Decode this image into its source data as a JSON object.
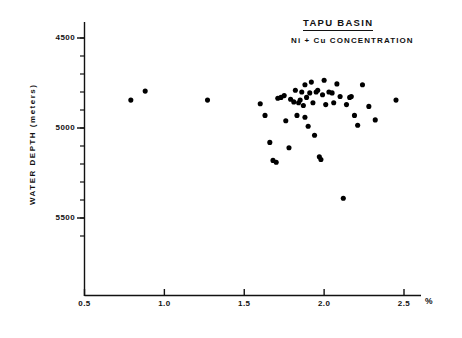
{
  "header": {
    "basin_title": "TAPU BASIN",
    "subtitle": "Ni + Cu  CONCENTRATION"
  },
  "axes": {
    "y_title": "WATER  DEPTH  (meters)",
    "y_ticks": [
      "4500",
      "5000",
      "5500"
    ],
    "x_ticks": [
      "0.5",
      "1.0",
      "1.5",
      "2.0",
      "2.5"
    ],
    "x_unit": "%"
  },
  "chart_data": {
    "type": "scatter",
    "title": "TAPU BASIN",
    "subtitle": "Ni + Cu CONCENTRATION",
    "xlabel": "%",
    "ylabel": "WATER DEPTH (meters)",
    "xlim": [
      0.5,
      2.5
    ],
    "ylim": [
      4300,
      5650
    ],
    "y_inverted": true,
    "grid": false,
    "legend": null,
    "x_ticks": [
      0.5,
      1.0,
      1.5,
      2.0,
      2.5
    ],
    "y_ticks": [
      4500,
      5000,
      5500
    ],
    "x_minor_step": 0.1,
    "y_minor_step": 100,
    "marker": "filled-circle",
    "marker_color": "#000000",
    "n_points": 51,
    "points": [
      {
        "x": 0.79,
        "y": 4845
      },
      {
        "x": 0.88,
        "y": 4795
      },
      {
        "x": 1.27,
        "y": 4845
      },
      {
        "x": 1.6,
        "y": 4865
      },
      {
        "x": 1.63,
        "y": 4930
      },
      {
        "x": 1.66,
        "y": 5080
      },
      {
        "x": 1.68,
        "y": 5180
      },
      {
        "x": 1.7,
        "y": 5190
      },
      {
        "x": 1.71,
        "y": 4835
      },
      {
        "x": 1.73,
        "y": 4830
      },
      {
        "x": 1.75,
        "y": 4820
      },
      {
        "x": 1.76,
        "y": 4960
      },
      {
        "x": 1.78,
        "y": 5110
      },
      {
        "x": 1.79,
        "y": 4840
      },
      {
        "x": 1.81,
        "y": 4855
      },
      {
        "x": 1.82,
        "y": 4790
      },
      {
        "x": 1.83,
        "y": 4930
      },
      {
        "x": 1.84,
        "y": 4860
      },
      {
        "x": 1.85,
        "y": 4845
      },
      {
        "x": 1.86,
        "y": 4800
      },
      {
        "x": 1.87,
        "y": 4875
      },
      {
        "x": 1.88,
        "y": 4760
      },
      {
        "x": 1.88,
        "y": 4940
      },
      {
        "x": 1.89,
        "y": 4830
      },
      {
        "x": 1.9,
        "y": 4990
      },
      {
        "x": 1.91,
        "y": 4805
      },
      {
        "x": 1.92,
        "y": 4745
      },
      {
        "x": 1.93,
        "y": 4860
      },
      {
        "x": 1.94,
        "y": 5040
      },
      {
        "x": 1.95,
        "y": 4800
      },
      {
        "x": 1.96,
        "y": 4790
      },
      {
        "x": 1.97,
        "y": 5160
      },
      {
        "x": 1.98,
        "y": 5175
      },
      {
        "x": 1.99,
        "y": 4815
      },
      {
        "x": 2.0,
        "y": 4735
      },
      {
        "x": 2.01,
        "y": 4870
      },
      {
        "x": 2.03,
        "y": 4800
      },
      {
        "x": 2.05,
        "y": 4805
      },
      {
        "x": 2.06,
        "y": 4860
      },
      {
        "x": 2.08,
        "y": 4755
      },
      {
        "x": 2.1,
        "y": 4825
      },
      {
        "x": 2.12,
        "y": 5390
      },
      {
        "x": 2.14,
        "y": 4870
      },
      {
        "x": 2.16,
        "y": 4830
      },
      {
        "x": 2.17,
        "y": 4825
      },
      {
        "x": 2.19,
        "y": 4930
      },
      {
        "x": 2.21,
        "y": 4985
      },
      {
        "x": 2.24,
        "y": 4760
      },
      {
        "x": 2.28,
        "y": 4880
      },
      {
        "x": 2.32,
        "y": 4955
      },
      {
        "x": 2.45,
        "y": 4845
      }
    ]
  }
}
